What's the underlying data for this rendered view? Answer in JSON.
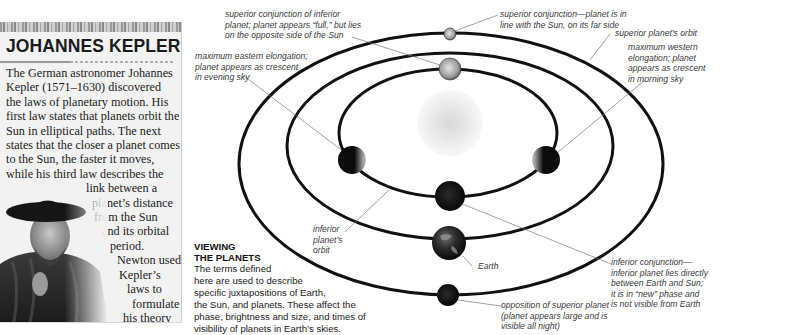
{
  "sidebar": {
    "title": "JOHANNES KEPLER",
    "body_lines": [
      "The German astronomer Johannes",
      "Kepler (1571–1630) discovered",
      "the laws of planetary motion. His",
      "first law states that planets orbit the",
      "Sun in elliptical paths. The next",
      "states that the closer a planet comes",
      "to the Sun, the faster it moves,",
      "while his third law describes the",
      "link between a",
      "planet’s distance",
      "from the Sun",
      "and its orbital",
      "period.",
      "Newton used",
      "Kepler’s",
      "laws to",
      "formulate",
      "his theory",
      "of gravity."
    ],
    "portrait_alt": "Portrait of Johannes Kepler"
  },
  "viewing": {
    "title_line1": "VIEWING",
    "title_line2": "THE PLANETS",
    "body_lines": [
      "The terms defined",
      "here are used to describe",
      "specific juxtapositions of Earth,",
      "the Sun, and planets. These affect the",
      "phase, brightness and size, and times of",
      "visibility of planets in Earth’s skies."
    ]
  },
  "labels": {
    "superior_conj_inferior": [
      "superior conjunction of inferior",
      "planet; planet appears “full,” but lies",
      "on the opposite side of the Sun"
    ],
    "superior_conj": [
      "superior conjunction—planet is in",
      "line with the Sun, on its far side"
    ],
    "superior_orbit": [
      "superior planet’s orbit"
    ],
    "max_western": [
      "maximum western",
      "elongation; planet",
      "appears as crescent",
      "in morning sky"
    ],
    "max_eastern": [
      "maximum eastern elongation;",
      "planet appears as crescent",
      "in evening sky"
    ],
    "inferior_orbit": [
      "inferior",
      "planet’s",
      "orbit"
    ],
    "earth": [
      "Earth"
    ],
    "inferior_conj": [
      "inferior conjunction—",
      "inferior planet lies directly",
      "between Earth and Sun;",
      "it is in “new” phase and",
      "is not visible from Earth"
    ],
    "opposition": [
      "opposition of superior planet",
      "(planet appears large and is",
      "visible all night)"
    ]
  },
  "colors": {
    "orbit": "#111111",
    "leader": "#7a7a7a",
    "sidebar_bg": "#f2f2f2",
    "label_text": "#3a3a3a"
  }
}
